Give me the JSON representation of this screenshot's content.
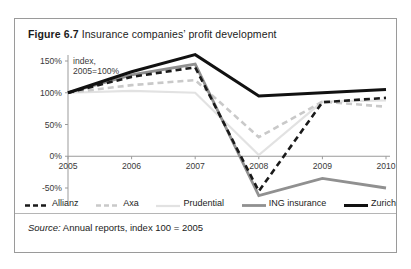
{
  "figure": {
    "label": "Figure 6.7",
    "title": "Insurance companies’ profit development",
    "source_prefix": "Source:",
    "source_text": " Annual reports, index 100 = 2005"
  },
  "colors": {
    "frame": "#9a9a9a",
    "axis": "#9b9b9b",
    "text": "#1b1b1b",
    "allianz": "#1a1a1a",
    "axa": "#c9c9c9",
    "prudential": "#e2e2e2",
    "ing": "#909090",
    "zurich": "#111111"
  },
  "chart_data": {
    "type": "line",
    "title": "Insurance companies’ profit development",
    "xlabel": "",
    "ylabel": "index, 2005=100%",
    "axis_note_line1": "index,",
    "axis_note_line2": "2005=100%",
    "x": [
      "2005",
      "2006",
      "2007",
      "2008",
      "2009",
      "2010"
    ],
    "categories": [
      "2005",
      "2006",
      "2007",
      "2008",
      "2009",
      "2010"
    ],
    "ylim": [
      -50,
      150
    ],
    "yticks": [
      150,
      100,
      50,
      0,
      -50
    ],
    "ytick_labels": [
      "150%",
      "100%",
      "50%",
      "0%",
      "-50%"
    ],
    "grid": false,
    "legend_position": "bottom",
    "series": [
      {
        "name": "Allianz",
        "style": "dashed",
        "color": "#1a1a1a",
        "width": 2.6,
        "values": [
          100,
          125,
          140,
          -55,
          85,
          92
        ]
      },
      {
        "name": "Axa",
        "style": "dashed",
        "color": "#c9c9c9",
        "width": 2.6,
        "values": [
          100,
          112,
          120,
          30,
          86,
          78
        ]
      },
      {
        "name": "Prudential",
        "style": "solid",
        "color": "#e2e2e2",
        "width": 2.2,
        "values": [
          100,
          103,
          100,
          2,
          86,
          88
        ]
      },
      {
        "name": "ING insurance",
        "style": "solid",
        "color": "#909090",
        "width": 2.8,
        "values": [
          100,
          128,
          145,
          -62,
          -35,
          -50
        ]
      },
      {
        "name": "Zurich",
        "style": "solid",
        "color": "#111111",
        "width": 3.0,
        "values": [
          100,
          133,
          160,
          95,
          100,
          105
        ]
      }
    ]
  },
  "legend": {
    "items": [
      {
        "label": "Allianz",
        "key": "allianz"
      },
      {
        "label": "Axa",
        "key": "axa"
      },
      {
        "label": "Prudential",
        "key": "prudential"
      },
      {
        "label": "ING insurance",
        "key": "ing"
      },
      {
        "label": "Zurich",
        "key": "zurich"
      }
    ]
  }
}
